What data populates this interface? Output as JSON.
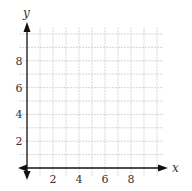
{
  "chart_data": {
    "type": "scatter",
    "title": "",
    "xlabel": "x",
    "ylabel": "y",
    "xlim": [
      -0.5,
      11
    ],
    "ylim": [
      -0.5,
      10.5
    ],
    "grid": true,
    "x_ticks": [
      2,
      4,
      6,
      8
    ],
    "y_ticks": [
      2,
      4,
      6,
      8
    ],
    "x_tick_labels": [
      "2",
      "4",
      "6",
      "8"
    ],
    "y_tick_labels": [
      "2",
      "4",
      "6",
      "8"
    ],
    "series": [],
    "legend": null
  },
  "colors": {
    "grid": "#cccccc",
    "axis": "#111111",
    "text": "#333333"
  }
}
